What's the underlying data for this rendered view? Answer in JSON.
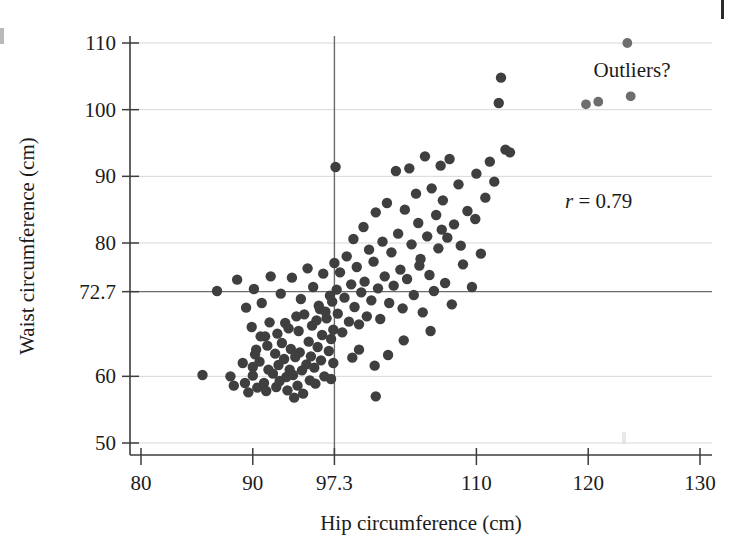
{
  "chart_data": {
    "type": "scatter",
    "title": "",
    "xlabel": "Hip circumference (cm)",
    "ylabel": "Waist circumference (cm)",
    "xlim": [
      80,
      131
    ],
    "ylim": [
      48,
      112
    ],
    "xticks": [
      80,
      90,
      97.3,
      110,
      120,
      130
    ],
    "xtick_labels": [
      "80",
      "90",
      "97.3",
      "110",
      "120",
      "130"
    ],
    "yticks": [
      50,
      60,
      72.7,
      80,
      90,
      100,
      110
    ],
    "ytick_labels": [
      "50",
      "60",
      "72.7",
      "80",
      "90",
      "100",
      "110"
    ],
    "gridlines_y": [
      50,
      60,
      80,
      90,
      100,
      110
    ],
    "grid": true,
    "legend": "none",
    "reference_lines": [
      {
        "orientation": "vertical",
        "value": 97.3,
        "label": "97.3",
        "axis": "x"
      },
      {
        "orientation": "horizontal",
        "value": 72.7,
        "label": "72.7",
        "axis": "y"
      }
    ],
    "annotations": [
      {
        "name": "correlation",
        "text": "r = 0.79",
        "italic_prefix": "r",
        "rest": " = 0.79",
        "x": 117.5,
        "y": 83.5
      },
      {
        "name": "outliers-callout",
        "text": "Outliers?",
        "x": 122.5,
        "y": 104.5
      }
    ],
    "point_style": {
      "color": "#3f3f3f",
      "radius_px": 5.2,
      "outlier_color": "#6e6e6e"
    },
    "n_points": 164,
    "points": [
      [
        85.5,
        60.2
      ],
      [
        88.0,
        60.0
      ],
      [
        88.3,
        58.6
      ],
      [
        89.1,
        62.0
      ],
      [
        89.3,
        59.0
      ],
      [
        89.6,
        57.6
      ],
      [
        90.0,
        61.4
      ],
      [
        90.0,
        60.1
      ],
      [
        90.2,
        63.3
      ],
      [
        90.4,
        58.3
      ],
      [
        90.6,
        62.2
      ],
      [
        90.7,
        66.0
      ],
      [
        91.0,
        59.0
      ],
      [
        91.2,
        57.8
      ],
      [
        91.3,
        64.6
      ],
      [
        91.4,
        61.0
      ],
      [
        91.5,
        68.1
      ],
      [
        91.8,
        60.4
      ],
      [
        92.0,
        63.4
      ],
      [
        92.1,
        58.4
      ],
      [
        92.2,
        66.4
      ],
      [
        92.3,
        61.7
      ],
      [
        92.4,
        59.3
      ],
      [
        92.6,
        65.0
      ],
      [
        92.8,
        62.6
      ],
      [
        93.0,
        59.9
      ],
      [
        93.1,
        57.9
      ],
      [
        93.2,
        67.2
      ],
      [
        93.3,
        61.0
      ],
      [
        93.4,
        64.1
      ],
      [
        93.6,
        60.2
      ],
      [
        93.8,
        62.9
      ],
      [
        94.0,
        58.6
      ],
      [
        94.1,
        66.8
      ],
      [
        94.2,
        63.6
      ],
      [
        94.4,
        60.9
      ],
      [
        94.6,
        69.3
      ],
      [
        94.8,
        61.8
      ],
      [
        95.0,
        65.2
      ],
      [
        95.1,
        59.4
      ],
      [
        95.2,
        63.0
      ],
      [
        95.3,
        67.6
      ],
      [
        95.5,
        61.3
      ],
      [
        95.6,
        58.9
      ],
      [
        95.8,
        64.4
      ],
      [
        96.0,
        70.1
      ],
      [
        96.1,
        62.4
      ],
      [
        96.2,
        66.2
      ],
      [
        96.4,
        60.0
      ],
      [
        96.6,
        68.7
      ],
      [
        96.8,
        63.8
      ],
      [
        97.0,
        65.6
      ],
      [
        97.0,
        59.6
      ],
      [
        97.1,
        71.2
      ],
      [
        97.2,
        62.0
      ],
      [
        86.8,
        72.8
      ],
      [
        88.6,
        74.5
      ],
      [
        89.4,
        70.3
      ],
      [
        90.1,
        73.1
      ],
      [
        90.8,
        71.0
      ],
      [
        91.6,
        75.0
      ],
      [
        92.5,
        72.4
      ],
      [
        93.5,
        74.8
      ],
      [
        94.3,
        71.6
      ],
      [
        94.9,
        76.2
      ],
      [
        95.4,
        73.4
      ],
      [
        95.9,
        70.6
      ],
      [
        96.3,
        75.4
      ],
      [
        96.9,
        72.1
      ],
      [
        97.3,
        77.0
      ],
      [
        92.9,
        68.0
      ],
      [
        93.9,
        69.0
      ],
      [
        95.7,
        68.4
      ],
      [
        96.5,
        69.7
      ],
      [
        97.2,
        67.0
      ],
      [
        89.9,
        67.4
      ],
      [
        91.1,
        66.0
      ],
      [
        90.3,
        64.0
      ],
      [
        94.5,
        57.4
      ],
      [
        93.7,
        56.8
      ],
      [
        97.4,
        91.4
      ],
      [
        97.5,
        73.0
      ],
      [
        97.6,
        69.4
      ],
      [
        97.8,
        75.6
      ],
      [
        98.0,
        66.6
      ],
      [
        98.2,
        71.8
      ],
      [
        98.4,
        78.0
      ],
      [
        98.6,
        68.2
      ],
      [
        98.8,
        73.8
      ],
      [
        99.0,
        80.6
      ],
      [
        99.1,
        70.4
      ],
      [
        99.3,
        76.4
      ],
      [
        99.5,
        67.8
      ],
      [
        99.7,
        72.6
      ],
      [
        99.9,
        82.4
      ],
      [
        100.0,
        74.2
      ],
      [
        100.2,
        69.0
      ],
      [
        100.4,
        79.0
      ],
      [
        100.6,
        71.4
      ],
      [
        100.8,
        77.2
      ],
      [
        101.0,
        84.6
      ],
      [
        101.2,
        73.2
      ],
      [
        101.4,
        68.6
      ],
      [
        101.6,
        80.2
      ],
      [
        101.8,
        75.0
      ],
      [
        102.0,
        86.0
      ],
      [
        102.2,
        71.0
      ],
      [
        102.4,
        78.6
      ],
      [
        102.6,
        73.6
      ],
      [
        102.8,
        90.8
      ],
      [
        103.0,
        81.4
      ],
      [
        103.2,
        76.0
      ],
      [
        103.4,
        70.2
      ],
      [
        103.6,
        85.0
      ],
      [
        103.8,
        74.6
      ],
      [
        104.0,
        91.2
      ],
      [
        104.2,
        79.8
      ],
      [
        104.4,
        72.2
      ],
      [
        104.6,
        87.4
      ],
      [
        104.8,
        83.0
      ],
      [
        105.0,
        77.6
      ],
      [
        105.2,
        69.6
      ],
      [
        105.4,
        93.0
      ],
      [
        105.6,
        81.0
      ],
      [
        105.8,
        75.2
      ],
      [
        106.0,
        88.2
      ],
      [
        106.2,
        72.8
      ],
      [
        106.4,
        84.2
      ],
      [
        106.6,
        79.2
      ],
      [
        106.8,
        91.6
      ],
      [
        107.0,
        86.4
      ],
      [
        107.2,
        74.0
      ],
      [
        107.4,
        80.8
      ],
      [
        107.6,
        92.6
      ],
      [
        107.8,
        70.8
      ],
      [
        108.0,
        82.8
      ],
      [
        108.4,
        88.8
      ],
      [
        108.8,
        76.8
      ],
      [
        109.2,
        84.8
      ],
      [
        109.6,
        73.4
      ],
      [
        110.0,
        90.4
      ],
      [
        110.4,
        78.4
      ],
      [
        110.8,
        86.8
      ],
      [
        111.2,
        92.2
      ],
      [
        111.6,
        89.2
      ],
      [
        112.0,
        101.0
      ],
      [
        112.2,
        104.8
      ],
      [
        112.6,
        94.0
      ],
      [
        101.0,
        57.0
      ],
      [
        99.5,
        64.0
      ],
      [
        108.6,
        79.6
      ],
      [
        105.9,
        66.8
      ],
      [
        103.5,
        65.4
      ],
      [
        102.1,
        63.2
      ],
      [
        100.9,
        61.6
      ],
      [
        98.9,
        62.8
      ],
      [
        104.9,
        76.6
      ],
      [
        109.9,
        83.6
      ],
      [
        113.0,
        93.6
      ],
      [
        106.9,
        82.0
      ]
    ],
    "outlier_points": [
      [
        119.8,
        100.8
      ],
      [
        123.5,
        110.0
      ],
      [
        123.8,
        102.0
      ],
      [
        120.9,
        101.2
      ]
    ]
  }
}
